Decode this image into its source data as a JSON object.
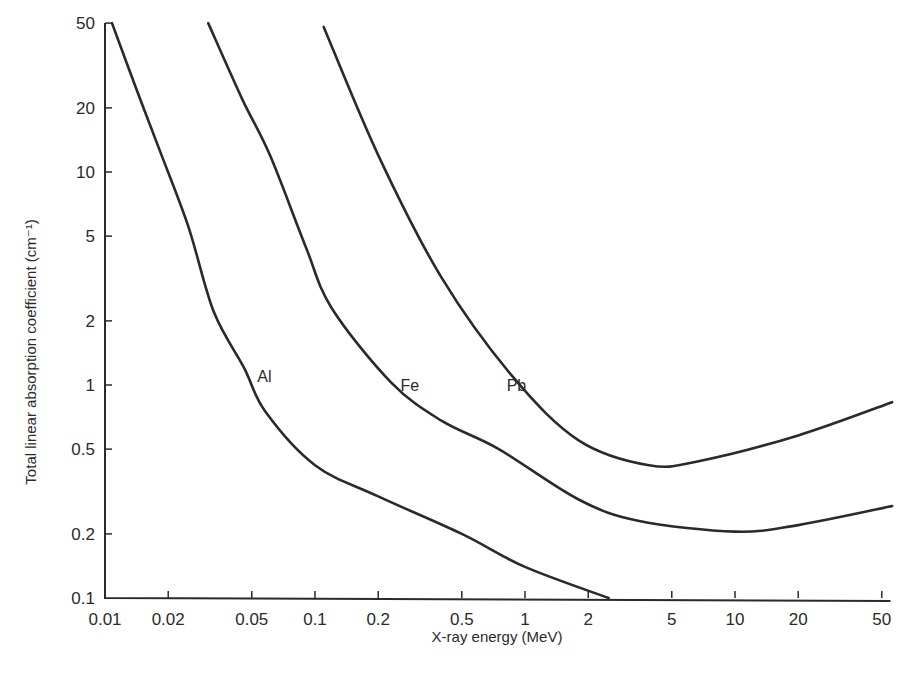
{
  "chart_data": {
    "type": "line",
    "title": "",
    "xlabel": "X-ray energy (MeV)",
    "ylabel": "Total linear absorption coefficient (cm⁻¹)",
    "x_scale": "log",
    "y_scale": "log",
    "xlim": [
      0.01,
      55
    ],
    "ylim": [
      0.1,
      50
    ],
    "grid": false,
    "legend": "inline labels on curves",
    "x_ticks": [
      0.01,
      0.02,
      0.05,
      0.1,
      0.2,
      0.5,
      1,
      2,
      5,
      10,
      20,
      50
    ],
    "x_tick_labels": [
      "0.01",
      "0.02",
      "0.05",
      "0.1",
      "0.2",
      "0.5",
      "1",
      "2",
      "5",
      "10",
      "20",
      "50"
    ],
    "y_ticks": [
      0.1,
      0.2,
      0.5,
      1,
      2,
      5,
      10,
      20,
      50
    ],
    "y_tick_labels": [
      "0.1",
      "0.2",
      "0.5",
      "1",
      "2",
      "5",
      "10",
      "20",
      "50"
    ],
    "series": [
      {
        "name": "Al",
        "label_position": {
          "x": 0.052,
          "y": 1.1
        },
        "points": [
          [
            0.0108,
            50
          ],
          [
            0.014,
            25
          ],
          [
            0.0183,
            12.5
          ],
          [
            0.025,
            5.5
          ],
          [
            0.033,
            2.2
          ],
          [
            0.046,
            1.2
          ],
          [
            0.058,
            0.75
          ],
          [
            0.1,
            0.42
          ],
          [
            0.2,
            0.3
          ],
          [
            0.5,
            0.2
          ],
          [
            1,
            0.14
          ],
          [
            2.5,
            0.1
          ]
        ]
      },
      {
        "name": "Fe",
        "label_position": {
          "x": 0.25,
          "y": 1.0
        },
        "points": [
          [
            0.031,
            50
          ],
          [
            0.045,
            22
          ],
          [
            0.061,
            12
          ],
          [
            0.09,
            4.5
          ],
          [
            0.12,
            2.3
          ],
          [
            0.23,
            1.03
          ],
          [
            0.4,
            0.68
          ],
          [
            0.75,
            0.5
          ],
          [
            1.8,
            0.29
          ],
          [
            3.5,
            0.23
          ],
          [
            10,
            0.205
          ],
          [
            20,
            0.22
          ],
          [
            56,
            0.27
          ]
        ]
      },
      {
        "name": "Pb",
        "label_position": {
          "x": 0.8,
          "y": 1.0
        },
        "points": [
          [
            0.11,
            48
          ],
          [
            0.2,
            12
          ],
          [
            0.4,
            3.2
          ],
          [
            0.87,
            1.1
          ],
          [
            1.8,
            0.55
          ],
          [
            3.9,
            0.42
          ],
          [
            6.8,
            0.44
          ],
          [
            20,
            0.58
          ],
          [
            56,
            0.83
          ]
        ]
      }
    ],
    "colors": {
      "line": "#2a2a2a",
      "background": "#ffffff"
    }
  }
}
